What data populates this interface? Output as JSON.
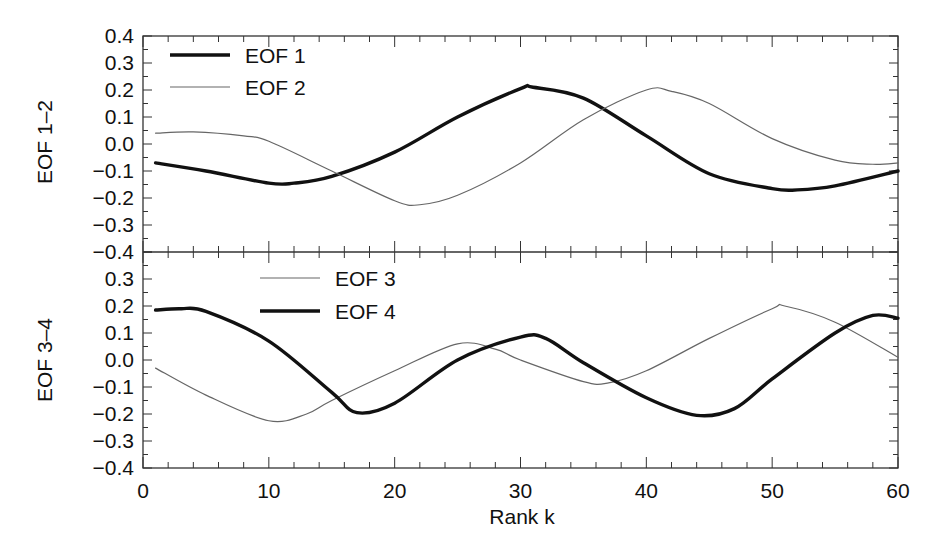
{
  "chart_data": [
    {
      "type": "line",
      "panel": "upper",
      "ylabel": "EOF 1–2",
      "xlabel": "",
      "xlim": [
        0,
        60
      ],
      "ylim": [
        -0.4,
        0.4
      ],
      "yticks": [
        "0.4",
        "0.3",
        "0.2",
        "0.1",
        "0.0",
        "−0.1",
        "−0.2",
        "−0.3",
        "−0.4"
      ],
      "grid": false,
      "legend_position": "upper left",
      "series": [
        {
          "name": "EOF 1",
          "style": "thick",
          "color": "#111111",
          "x": [
            1,
            5,
            10,
            12,
            15,
            20,
            25,
            30,
            31,
            35,
            40,
            45,
            50,
            52,
            55,
            60
          ],
          "values": [
            -0.07,
            -0.1,
            -0.145,
            -0.145,
            -0.12,
            -0.03,
            0.1,
            0.205,
            0.21,
            0.17,
            0.03,
            -0.11,
            -0.165,
            -0.17,
            -0.155,
            -0.1
          ]
        },
        {
          "name": "EOF 2",
          "style": "thin",
          "color": "#666666",
          "x": [
            1,
            4,
            8,
            10,
            15,
            20,
            22,
            25,
            30,
            35,
            40,
            42,
            45,
            50,
            55,
            58,
            60
          ],
          "values": [
            0.04,
            0.045,
            0.03,
            0.01,
            -0.1,
            -0.21,
            -0.225,
            -0.19,
            -0.07,
            0.09,
            0.2,
            0.195,
            0.15,
            0.02,
            -0.06,
            -0.075,
            -0.07
          ]
        }
      ]
    },
    {
      "type": "line",
      "panel": "lower",
      "ylabel": "EOF 3–4",
      "xlabel": "Rank k",
      "xlim": [
        0,
        60
      ],
      "ylim": [
        -0.4,
        0.4
      ],
      "xticks": [
        "0",
        "10",
        "20",
        "30",
        "40",
        "50",
        "60"
      ],
      "yticks": [
        "0.3",
        "0.2",
        "0.1",
        "0.0",
        "−0.1",
        "−0.2",
        "−0.3",
        "−0.4"
      ],
      "grid": false,
      "legend_position": "upper center-left",
      "series": [
        {
          "name": "EOF 3",
          "style": "thin",
          "color": "#666666",
          "x": [
            1,
            5,
            10,
            13,
            15,
            20,
            25,
            28,
            30,
            35,
            37,
            40,
            45,
            50,
            51,
            55,
            60
          ],
          "values": [
            -0.03,
            -0.13,
            -0.225,
            -0.2,
            -0.15,
            -0.04,
            0.06,
            0.04,
            0.0,
            -0.08,
            -0.085,
            -0.04,
            0.08,
            0.19,
            0.2,
            0.14,
            0.01
          ]
        },
        {
          "name": "EOF 4",
          "style": "thick",
          "color": "#111111",
          "x": [
            1,
            3,
            5,
            10,
            15,
            17,
            20,
            25,
            30,
            32,
            35,
            40,
            44,
            47,
            50,
            55,
            58,
            60
          ],
          "values": [
            0.185,
            0.19,
            0.18,
            0.07,
            -0.12,
            -0.195,
            -0.16,
            0.0,
            0.085,
            0.08,
            -0.01,
            -0.14,
            -0.205,
            -0.18,
            -0.07,
            0.1,
            0.165,
            0.155
          ]
        }
      ]
    }
  ],
  "labels": {
    "upper_ylabel": "EOF 1–2",
    "lower_ylabel": "EOF 3–4",
    "xlabel": "Rank k",
    "legend_upper": [
      "EOF 1",
      "EOF 2"
    ],
    "legend_lower": [
      "EOF 3",
      "EOF 4"
    ]
  }
}
